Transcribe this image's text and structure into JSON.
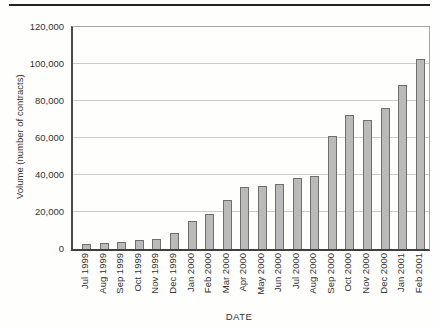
{
  "figure": {
    "top_rule_color": "#232323",
    "background_color": "#fefefd"
  },
  "chart_data": {
    "type": "bar",
    "title": "",
    "xlabel": "DATE",
    "ylabel": "Volume (number of contracts)",
    "categories": [
      "Jul 1999",
      "Aug 1999",
      "Sep 1999",
      "Oct 1999",
      "Nov 1999",
      "Dec 1999",
      "Jan 2000",
      "Feb 2000",
      "Mar 2000",
      "Apr 2000",
      "May 2000",
      "Jun 2000",
      "Jul 2000",
      "Aug 2000",
      "Sep 2000",
      "Oct 2000",
      "Nov 2000",
      "Dec 2000",
      "Jan 2001",
      "Feb 2001"
    ],
    "values": [
      2500,
      3000,
      4000,
      5000,
      5500,
      8500,
      15000,
      19000,
      26500,
      33500,
      34000,
      35000,
      38500,
      39500,
      61000,
      72500,
      69500,
      76000,
      88500,
      102500
    ],
    "ylim": [
      0,
      120000
    ],
    "ytick_interval": 20000,
    "ytick_labels": [
      "0",
      "20,000",
      "40,000",
      "60,000",
      "80,000",
      "100,000",
      "120,000"
    ],
    "grid": "horizontal",
    "legend": "none",
    "bar_color": "#bababa",
    "bar_border_color": "#6f6f6f",
    "gridline_color": "#cbcbcb"
  }
}
